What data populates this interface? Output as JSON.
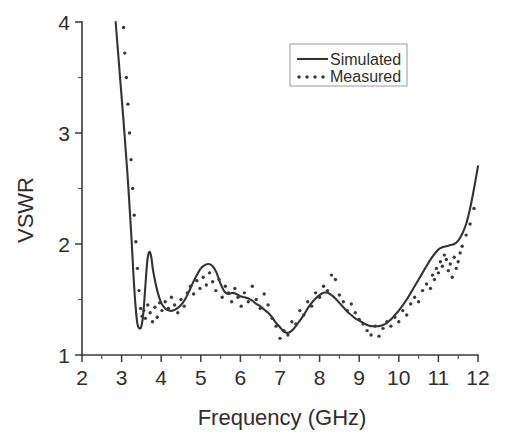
{
  "chart_data": {
    "type": "line",
    "title": "",
    "xlabel": "Frequency (GHz)",
    "ylabel": "VSWR",
    "xlim": [
      2,
      12
    ],
    "ylim": [
      1,
      4
    ],
    "grid": false,
    "legend_position": "top-right",
    "x_ticks": [
      2,
      3,
      4,
      5,
      6,
      7,
      8,
      9,
      10,
      11,
      12
    ],
    "x_tick_labels": [
      "2",
      "3",
      "4",
      "5",
      "6",
      "7",
      "8",
      "9",
      "10",
      "11",
      "12"
    ],
    "x_minor_ticks": [
      2.5,
      3.5,
      4.5,
      5.5,
      6.5,
      7.5,
      8.5,
      9.5,
      10.5,
      11.5
    ],
    "y_ticks": [
      1,
      2,
      3,
      4
    ],
    "y_tick_labels": [
      "1",
      "2",
      "3",
      "4"
    ],
    "y_minor_ticks": [
      1.5,
      2.5,
      3.5
    ],
    "series": [
      {
        "name": "Simulated",
        "style": "solid",
        "x": [
          2.85,
          2.95,
          3.05,
          3.15,
          3.25,
          3.3,
          3.35,
          3.4,
          3.45,
          3.5,
          3.55,
          3.6,
          3.65,
          3.7,
          3.75,
          3.8,
          3.9,
          4.0,
          4.1,
          4.2,
          4.3,
          4.4,
          4.5,
          4.6,
          4.7,
          4.8,
          4.9,
          5.0,
          5.1,
          5.2,
          5.3,
          5.4,
          5.5,
          5.6,
          5.7,
          5.8,
          5.9,
          6.0,
          6.1,
          6.2,
          6.3,
          6.4,
          6.5,
          6.6,
          6.7,
          6.8,
          6.9,
          7.0,
          7.1,
          7.2,
          7.3,
          7.4,
          7.5,
          7.6,
          7.7,
          7.8,
          7.9,
          8.0,
          8.1,
          8.2,
          8.3,
          8.4,
          8.5,
          8.6,
          8.7,
          8.8,
          8.9,
          9.0,
          9.1,
          9.2,
          9.3,
          9.4,
          9.5,
          9.6,
          9.7,
          9.8,
          9.9,
          10.0,
          10.2,
          10.4,
          10.6,
          10.8,
          11.0,
          11.1,
          11.2,
          11.3,
          11.4,
          11.5,
          11.6,
          11.7,
          11.8,
          11.9,
          12.0
        ],
        "y": [
          4.0,
          3.55,
          3.1,
          2.62,
          2.05,
          1.72,
          1.45,
          1.28,
          1.24,
          1.26,
          1.38,
          1.62,
          1.85,
          1.93,
          1.88,
          1.75,
          1.58,
          1.47,
          1.42,
          1.4,
          1.4,
          1.42,
          1.45,
          1.5,
          1.57,
          1.65,
          1.72,
          1.78,
          1.81,
          1.82,
          1.8,
          1.74,
          1.64,
          1.57,
          1.55,
          1.56,
          1.55,
          1.53,
          1.52,
          1.51,
          1.49,
          1.46,
          1.44,
          1.41,
          1.38,
          1.34,
          1.29,
          1.25,
          1.21,
          1.2,
          1.22,
          1.26,
          1.31,
          1.36,
          1.42,
          1.47,
          1.51,
          1.54,
          1.56,
          1.56,
          1.54,
          1.51,
          1.47,
          1.43,
          1.39,
          1.36,
          1.33,
          1.31,
          1.29,
          1.27,
          1.26,
          1.26,
          1.26,
          1.27,
          1.29,
          1.32,
          1.36,
          1.4,
          1.5,
          1.62,
          1.74,
          1.86,
          1.95,
          1.97,
          1.98,
          1.99,
          2.0,
          2.03,
          2.09,
          2.18,
          2.32,
          2.5,
          2.7
        ]
      },
      {
        "name": "Measured",
        "style": "dotted",
        "x": [
          3.05,
          3.08,
          3.12,
          3.16,
          3.2,
          3.24,
          3.28,
          3.32,
          3.36,
          3.4,
          3.44,
          3.48,
          3.52,
          3.56,
          3.6,
          3.66,
          3.72,
          3.78,
          3.84,
          3.9,
          3.96,
          4.02,
          4.1,
          4.18,
          4.26,
          4.34,
          4.42,
          4.5,
          4.58,
          4.66,
          4.74,
          4.82,
          4.9,
          4.98,
          5.06,
          5.14,
          5.22,
          5.3,
          5.38,
          5.46,
          5.54,
          5.62,
          5.7,
          5.78,
          5.86,
          5.94,
          6.02,
          6.1,
          6.2,
          6.3,
          6.4,
          6.5,
          6.6,
          6.7,
          6.8,
          6.9,
          7.0,
          7.1,
          7.2,
          7.3,
          7.4,
          7.5,
          7.6,
          7.7,
          7.8,
          7.9,
          8.0,
          8.1,
          8.2,
          8.3,
          8.4,
          8.5,
          8.6,
          8.7,
          8.8,
          8.9,
          9.0,
          9.1,
          9.2,
          9.3,
          9.4,
          9.5,
          9.6,
          9.7,
          9.8,
          9.9,
          10.0,
          10.1,
          10.2,
          10.3,
          10.4,
          10.5,
          10.6,
          10.7,
          10.8,
          10.85,
          10.9,
          10.95,
          11.0,
          11.05,
          11.1,
          11.15,
          11.2,
          11.25,
          11.3,
          11.35,
          11.4,
          11.45,
          11.5,
          11.55,
          11.6,
          11.7,
          11.8,
          11.9
        ],
        "y": [
          3.95,
          3.72,
          3.5,
          3.26,
          3.0,
          2.76,
          2.5,
          2.26,
          2.02,
          1.78,
          1.58,
          1.42,
          1.35,
          1.4,
          1.33,
          1.45,
          1.38,
          1.3,
          1.43,
          1.34,
          1.47,
          1.4,
          1.48,
          1.42,
          1.52,
          1.45,
          1.38,
          1.5,
          1.44,
          1.56,
          1.62,
          1.55,
          1.67,
          1.6,
          1.7,
          1.63,
          1.74,
          1.66,
          1.58,
          1.68,
          1.52,
          1.62,
          1.56,
          1.48,
          1.6,
          1.52,
          1.44,
          1.56,
          1.48,
          1.62,
          1.5,
          1.42,
          1.55,
          1.45,
          1.33,
          1.26,
          1.15,
          1.22,
          1.18,
          1.3,
          1.28,
          1.4,
          1.36,
          1.48,
          1.44,
          1.56,
          1.52,
          1.62,
          1.58,
          1.72,
          1.68,
          1.54,
          1.48,
          1.4,
          1.46,
          1.38,
          1.32,
          1.28,
          1.22,
          1.18,
          1.26,
          1.17,
          1.24,
          1.3,
          1.26,
          1.34,
          1.3,
          1.4,
          1.36,
          1.46,
          1.52,
          1.48,
          1.58,
          1.64,
          1.6,
          1.72,
          1.68,
          1.78,
          1.74,
          1.84,
          1.8,
          1.9,
          1.86,
          1.76,
          1.82,
          1.7,
          1.88,
          1.78,
          1.84,
          1.92,
          1.98,
          2.08,
          2.18,
          2.32
        ]
      }
    ]
  },
  "legend": {
    "entries": [
      {
        "label": "Simulated",
        "style": "solid"
      },
      {
        "label": "Measured",
        "style": "dotted"
      }
    ]
  }
}
